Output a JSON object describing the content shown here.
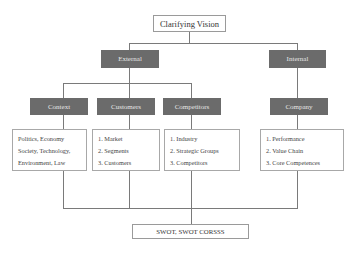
{
  "top": {
    "label": "Clarifying Vision"
  },
  "level1": [
    {
      "label": "External"
    },
    {
      "label": "Internal"
    }
  ],
  "level2": [
    {
      "label": "Context"
    },
    {
      "label": "Customers"
    },
    {
      "label": "Competitors"
    },
    {
      "label": "Company"
    }
  ],
  "details": {
    "context": [
      "Politics, Economy",
      "Society, Technology,",
      "Environment, Law"
    ],
    "customers": [
      "1.  Market",
      "2. Segments",
      "3. Customers"
    ],
    "competitors": [
      "1.  Industry",
      "2.  Strategic Groups",
      "3.  Competitors"
    ],
    "company": [
      "1.  Performance",
      "2.  Value Chain",
      "3.  Core Competences"
    ]
  },
  "bottom": {
    "label": "SWOT, SWOT CORSSS"
  },
  "colors": {
    "dark_box": "#6b6b6b",
    "line": "#7a7a7a",
    "border": "#9a9a9a"
  }
}
